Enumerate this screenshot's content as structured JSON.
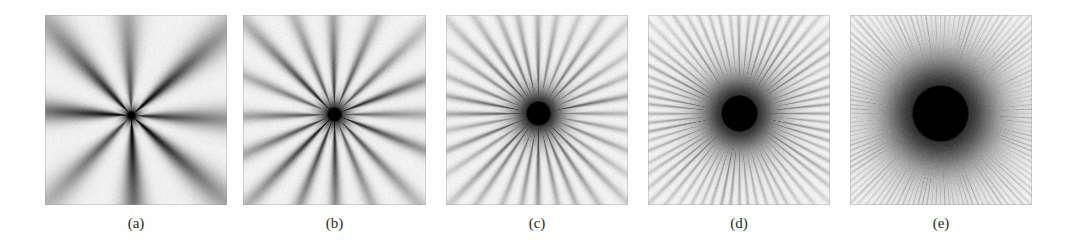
{
  "figure": {
    "background_color": "#fefefe",
    "panel_background_color": "#f2f2f2",
    "ray_color": "#2a2a2a",
    "label_color": "#2b2b2b",
    "width": 1071,
    "height": 249,
    "panel_count": 5,
    "panels": [
      {
        "label": "(a)",
        "x": 45,
        "y": 15,
        "width": 182,
        "height": 190,
        "center_x": 86,
        "center_y": 100,
        "ray_count": 8,
        "core_radius": 3,
        "halo_radius": 12,
        "ray_length": 110,
        "ray_darkness": 0.95,
        "seed": 11,
        "noise": 0.1
      },
      {
        "label": "(b)",
        "x": 243,
        "y": 15,
        "width": 183,
        "height": 190,
        "center_x": 91,
        "center_y": 99,
        "ray_count": 16,
        "core_radius": 6,
        "halo_radius": 18,
        "ray_length": 95,
        "ray_darkness": 0.88,
        "seed": 23,
        "noise": 0.1
      },
      {
        "label": "(c)",
        "x": 446,
        "y": 15,
        "width": 182,
        "height": 190,
        "center_x": 92,
        "center_y": 98,
        "ray_count": 32,
        "core_radius": 11,
        "halo_radius": 28,
        "ray_length": 80,
        "ray_darkness": 0.72,
        "seed": 37,
        "noise": 0.11
      },
      {
        "label": "(d)",
        "x": 648,
        "y": 15,
        "width": 182,
        "height": 190,
        "center_x": 91,
        "center_y": 98,
        "ray_count": 64,
        "core_radius": 17,
        "halo_radius": 42,
        "ray_length": 78,
        "ray_darkness": 0.6,
        "seed": 53,
        "noise": 0.12
      },
      {
        "label": "(e)",
        "x": 850,
        "y": 15,
        "width": 182,
        "height": 190,
        "center_x": 90,
        "center_y": 98,
        "ray_count": 128,
        "core_radius": 27,
        "halo_radius": 58,
        "ray_length": 76,
        "ray_darkness": 0.5,
        "seed": 71,
        "noise": 0.13
      }
    ],
    "label_row_y": 214,
    "caption": ""
  }
}
